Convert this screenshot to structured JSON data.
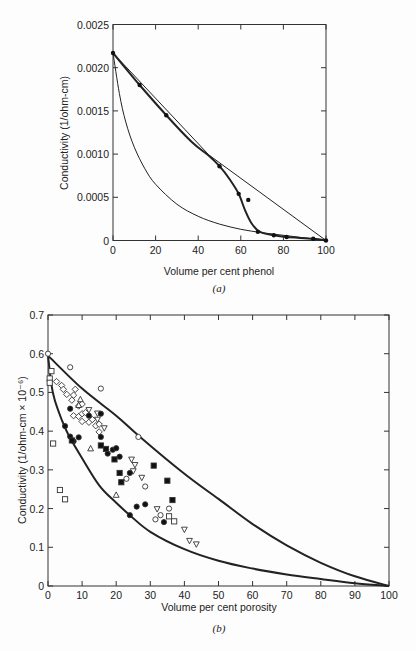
{
  "chart_data": [
    {
      "id": "a",
      "type": "line",
      "caption": "(a)",
      "xlabel": "Volume per cent phenol",
      "ylabel": "Conductivity (1/ohm-cm)",
      "xlim": [
        0,
        100
      ],
      "ylim": [
        0,
        0.0025
      ],
      "xticks": [
        "0",
        "20",
        "40",
        "60",
        "80",
        "100"
      ],
      "yticks": [
        "0",
        "0.0005",
        "0.0010",
        "0.0015",
        "0.0020",
        "0.0025"
      ],
      "grid": false,
      "series": [
        {
          "name": "measured",
          "style": "thick",
          "markers": true,
          "points": [
            [
              0,
              0.00217
            ],
            [
              12.5,
              0.0018
            ],
            [
              25,
              0.00145
            ],
            [
              50,
              0.00086
            ],
            [
              59,
              0.00054
            ],
            [
              68,
              0.0001
            ],
            [
              75.5,
              6e-05
            ],
            [
              81.5,
              4e-05
            ],
            [
              94,
              2e-05
            ],
            [
              100,
              0
            ]
          ],
          "curve": [
            [
              0,
              0.00217
            ],
            [
              12.5,
              0.0018
            ],
            [
              25,
              0.00145
            ],
            [
              37,
              0.00114
            ],
            [
              45,
              0.00098
            ],
            [
              50,
              0.00086
            ],
            [
              55,
              0.0007
            ],
            [
              59,
              0.00054
            ],
            [
              62,
              0.00035
            ],
            [
              65,
              0.0002
            ],
            [
              69,
              0.0001
            ],
            [
              75.5,
              6e-05
            ],
            [
              81.5,
              4e-05
            ],
            [
              94,
              2e-05
            ],
            [
              100,
              0
            ]
          ]
        },
        {
          "name": "outlier",
          "markers": true,
          "points": [
            [
              63.5,
              0.00047
            ]
          ]
        },
        {
          "name": "upper bound (linear)",
          "style": "thin",
          "curve": [
            [
              0,
              0.00217
            ],
            [
              45,
              0.00099
            ],
            [
              100,
              0
            ]
          ]
        },
        {
          "name": "lower bound",
          "style": "thin",
          "curve": [
            [
              0,
              0.00217
            ],
            [
              3,
              0.0017
            ],
            [
              6,
              0.00137
            ],
            [
              10,
              0.00108
            ],
            [
              15,
              0.00083
            ],
            [
              20,
              0.00065
            ],
            [
              30,
              0.00042
            ],
            [
              40,
              0.00028
            ],
            [
              50,
              0.00019
            ],
            [
              60,
              0.00013
            ],
            [
              70,
              9e-05
            ],
            [
              80,
              6e-05
            ],
            [
              90,
              3e-05
            ],
            [
              100,
              0
            ]
          ]
        }
      ]
    },
    {
      "id": "b",
      "type": "scatter",
      "caption": "(b)",
      "xlabel": "Volume per cent porosity",
      "ylabel": "Conductivity (1/ohm-cm × 10⁻⁶)",
      "xlim": [
        0,
        100
      ],
      "ylim": [
        0,
        0.7
      ],
      "xticks": [
        "0",
        "10",
        "20",
        "30",
        "40",
        "50",
        "60",
        "70",
        "80",
        "90",
        "100"
      ],
      "yticks": [
        "0",
        "0.1",
        "0.2",
        "0.3",
        "0.4",
        "0.5",
        "0.6",
        "0.7"
      ],
      "grid": false,
      "bounds": [
        {
          "name": "upper bound",
          "curve": [
            [
              0,
              0.595
            ],
            [
              10,
              0.51
            ],
            [
              20,
              0.44
            ],
            [
              27,
              0.385
            ],
            [
              40,
              0.29
            ],
            [
              50,
              0.225
            ],
            [
              60,
              0.16
            ],
            [
              70,
              0.105
            ],
            [
              80,
              0.06
            ],
            [
              90,
              0.025
            ],
            [
              100,
              0
            ]
          ]
        },
        {
          "name": "lower bound",
          "curve": [
            [
              0,
              0.595
            ],
            [
              1,
              0.52
            ],
            [
              2,
              0.48
            ],
            [
              4,
              0.43
            ],
            [
              6,
              0.39
            ],
            [
              10,
              0.33
            ],
            [
              15,
              0.26
            ],
            [
              20,
              0.215
            ],
            [
              24,
              0.183
            ],
            [
              30,
              0.14
            ],
            [
              40,
              0.095
            ],
            [
              50,
              0.065
            ],
            [
              60,
              0.045
            ],
            [
              70,
              0.03
            ],
            [
              80,
              0.018
            ],
            [
              90,
              0.007
            ],
            [
              100,
              0
            ]
          ]
        }
      ],
      "series": [
        {
          "name": "open circle",
          "marker": "circle-open",
          "points": [
            [
              0,
              0.6
            ],
            [
              6.5,
              0.565
            ],
            [
              15.5,
              0.51
            ],
            [
              26.5,
              0.385
            ],
            [
              23,
              0.277
            ],
            [
              28.5,
              0.257
            ],
            [
              31.5,
              0.172
            ],
            [
              33,
              0.183
            ],
            [
              35.5,
              0.2
            ]
          ]
        },
        {
          "name": "open square",
          "marker": "square-open",
          "points": [
            [
              1,
              0.555
            ],
            [
              0.5,
              0.536
            ],
            [
              0.5,
              0.525
            ],
            [
              1.5,
              0.368
            ],
            [
              3.5,
              0.248
            ],
            [
              5,
              0.224
            ],
            [
              35.5,
              0.18
            ],
            [
              37,
              0.167
            ]
          ]
        },
        {
          "name": "open diamond",
          "marker": "diamond-open",
          "points": [
            [
              2.5,
              0.528
            ],
            [
              4,
              0.518
            ],
            [
              4.5,
              0.508
            ],
            [
              5.5,
              0.495
            ],
            [
              7,
              0.48
            ],
            [
              7.5,
              0.493
            ],
            [
              8,
              0.508
            ],
            [
              7.5,
              0.44
            ],
            [
              9,
              0.438
            ],
            [
              10,
              0.445
            ],
            [
              10,
              0.425
            ],
            [
              12,
              0.423
            ],
            [
              13,
              0.43
            ],
            [
              14,
              0.414
            ],
            [
              15,
              0.418
            ],
            [
              15,
              0.398
            ],
            [
              11,
              0.448
            ],
            [
              9,
              0.465
            ],
            [
              10,
              0.47
            ]
          ]
        },
        {
          "name": "open up-triangle",
          "marker": "triangle-up-open",
          "points": [
            [
              12.5,
              0.355
            ],
            [
              20,
              0.235
            ],
            [
              9.5,
              0.482
            ],
            [
              9,
              0.467
            ]
          ]
        },
        {
          "name": "open down-triangle",
          "marker": "triangle-down-open",
          "points": [
            [
              12,
              0.455
            ],
            [
              14.5,
              0.43
            ],
            [
              16.5,
              0.408
            ],
            [
              24.5,
              0.327
            ],
            [
              25.5,
              0.313
            ],
            [
              25,
              0.297
            ],
            [
              27.5,
              0.28
            ],
            [
              32,
              0.199
            ],
            [
              40,
              0.146
            ],
            [
              41.5,
              0.117
            ],
            [
              43.5,
              0.108
            ],
            [
              14.5,
              0.446
            ]
          ]
        },
        {
          "name": "filled circle",
          "marker": "circle-filled",
          "points": [
            [
              5,
              0.413
            ],
            [
              6.5,
              0.458
            ],
            [
              6.5,
              0.386
            ],
            [
              7.5,
              0.374
            ],
            [
              9,
              0.384
            ],
            [
              12,
              0.44
            ],
            [
              15.5,
              0.445
            ],
            [
              15.5,
              0.385
            ],
            [
              17.5,
              0.342
            ],
            [
              19,
              0.352
            ],
            [
              20,
              0.356
            ],
            [
              21,
              0.334
            ],
            [
              24,
              0.292
            ],
            [
              26,
              0.205
            ],
            [
              28.5,
              0.211
            ],
            [
              24,
              0.183
            ],
            [
              34,
              0.165
            ]
          ]
        },
        {
          "name": "filled square",
          "marker": "square-filled",
          "points": [
            [
              7,
              0.376
            ],
            [
              15.5,
              0.363
            ],
            [
              17,
              0.354
            ],
            [
              19.5,
              0.327
            ],
            [
              21,
              0.292
            ],
            [
              21.5,
              0.268
            ],
            [
              31,
              0.311
            ],
            [
              35,
              0.272
            ],
            [
              36.5,
              0.222
            ]
          ]
        }
      ]
    }
  ]
}
